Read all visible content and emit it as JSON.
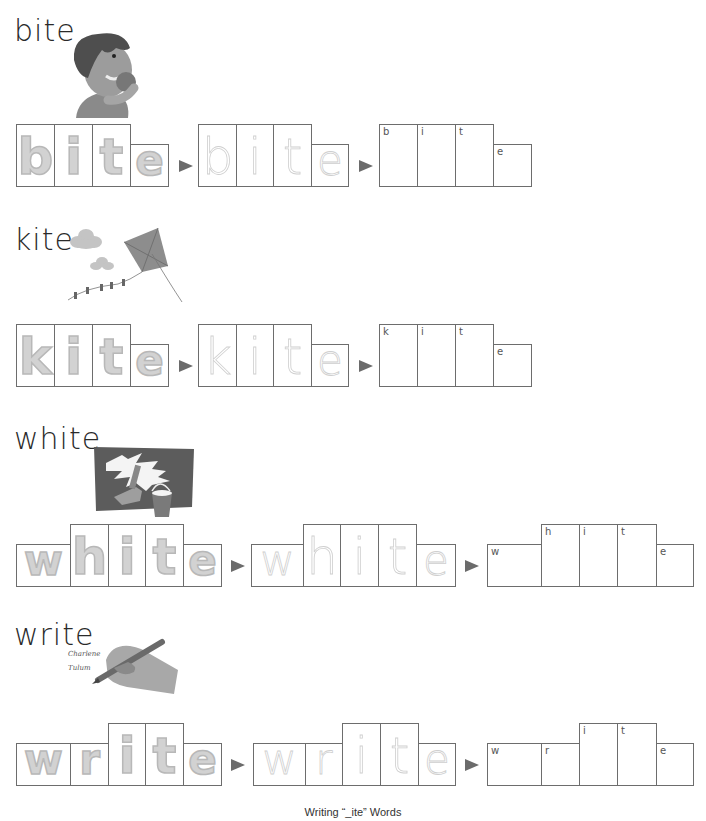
{
  "worksheet": {
    "caption": "Writing “_ite” Words",
    "arrow_color": "#6b6b6b",
    "words": [
      {
        "word": "bite",
        "illustration": "boy-biting-apple-illustration",
        "letters": [
          "b",
          "i",
          "t",
          "e"
        ],
        "hints": [
          "b",
          "i",
          "t",
          "e"
        ]
      },
      {
        "word": "kite",
        "illustration": "kite-and-clouds-illustration",
        "letters": [
          "k",
          "i",
          "t",
          "e"
        ],
        "hints": [
          "k",
          "i",
          "t",
          "e"
        ]
      },
      {
        "word": "white",
        "illustration": "white-paint-bucket-illustration",
        "letters": [
          "w",
          "h",
          "i",
          "t",
          "e"
        ],
        "hints": [
          "w",
          "h",
          "i",
          "t",
          "e"
        ]
      },
      {
        "word": "write",
        "illustration": "hand-writing-pencil-illustration",
        "letters": [
          "w",
          "r",
          "i",
          "t",
          "e"
        ],
        "hints": [
          "w",
          "r",
          "i",
          "t",
          "e"
        ]
      }
    ]
  }
}
